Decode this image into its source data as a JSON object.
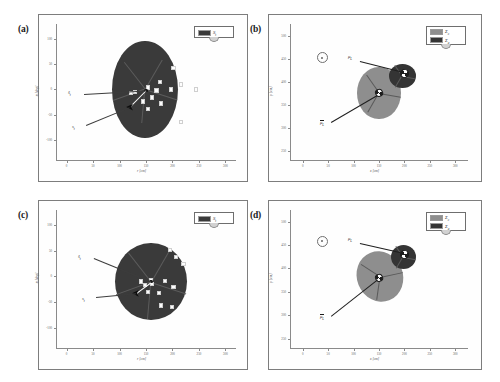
{
  "figure": {
    "panels": [
      {
        "tag": "(a)",
        "legend": [
          {
            "label": "S",
            "sub": "t",
            "color": "#3a3a3a"
          }
        ],
        "annotations": [
          {
            "label": "ŝ",
            "sub": "t"
          },
          {
            "label": "s",
            "sub": "t"
          }
        ],
        "chart_data": {
          "type": "scatter",
          "title": "",
          "xlabel": "r [cm]",
          "ylabel": "α [deg]",
          "xlim": [
            -20,
            320
          ],
          "ylim": [
            -140,
            130
          ],
          "xticks": [
            0,
            50,
            100,
            150,
            200,
            250,
            300
          ],
          "xticklabels": [
            "0",
            "50",
            "100",
            "150",
            "200",
            "250",
            "300"
          ],
          "yticks": [
            -100,
            -50,
            0,
            50,
            100
          ],
          "yticklabels": [
            "-100",
            "-50",
            "0",
            "50",
            "100"
          ],
          "grid": false,
          "legend_position": "upper-right",
          "region": {
            "name": "S_t",
            "shape": "ellipse",
            "center": [
              148,
              0
            ],
            "semi_axis_x": 62,
            "semi_axis_y": 97,
            "fill": "#3a3a3a"
          },
          "points": [
            [
              200,
              45
            ],
            [
              175,
              17
            ],
            [
              215,
              12
            ],
            [
              243,
              2
            ],
            [
              128,
              -3
            ],
            [
              152,
              6
            ],
            [
              168,
              0
            ],
            [
              196,
              2
            ],
            [
              143,
              -22
            ],
            [
              176,
              -26
            ],
            [
              152,
              -37
            ],
            [
              214,
              -63
            ],
            [
              120,
              -5
            ],
            [
              160,
              -14
            ]
          ],
          "estimate_point": [
            119,
            -35
          ],
          "true_point": [
            150,
            -2
          ]
        }
      },
      {
        "tag": "(b)",
        "legend": [
          {
            "label": "Σ",
            "sub": "c",
            "color": "#8e8e8e"
          },
          {
            "label": "Σ",
            "sub": "a",
            "color": "#343434"
          }
        ],
        "annotations": [
          {
            "label": "μ",
            "sub": "L"
          },
          {
            "label": "μ̄",
            "sub": "L"
          }
        ],
        "chart_data": {
          "type": "scatter",
          "title": "",
          "xlabel": "x [cm]",
          "ylabel": "y [cm]",
          "xlim": [
            -25,
            325
          ],
          "ylim": [
            230,
            525
          ],
          "xticks": [
            0,
            50,
            100,
            150,
            200,
            250,
            300
          ],
          "xticklabels": [
            "0",
            "50",
            "100",
            "150",
            "200",
            "250",
            "300"
          ],
          "yticks": [
            250,
            300,
            350,
            400,
            450,
            500
          ],
          "yticklabels": [
            "250",
            "300",
            "350",
            "400",
            "450",
            "500"
          ],
          "grid": false,
          "legend_position": "upper-right",
          "ellipses": [
            {
              "name": "Σ_c",
              "center": [
                150,
                375
              ],
              "semi_axis_x": 43,
              "semi_axis_y": 57,
              "angle": 0,
              "fill": "#8e8e8e"
            },
            {
              "name": "Σ_a",
              "center": [
                196,
                412
              ],
              "semi_axis_x": 26,
              "semi_axis_y": 26,
              "angle": 0,
              "fill": "#343434"
            }
          ],
          "markers": [
            {
              "name": "μ_L",
              "position": [
                200,
                418
              ],
              "style": "pie-quadrant"
            },
            {
              "name": "μ̄_L",
              "position": [
                150,
                375
              ],
              "style": "pie-quadrant"
            }
          ],
          "reference_marker": {
            "position": [
              38,
              452
            ],
            "style": "circle-dot"
          }
        }
      },
      {
        "tag": "(c)",
        "legend": [
          {
            "label": "S",
            "sub": "t",
            "color": "#3a3a3a"
          }
        ],
        "annotations": [
          {
            "label": "ŝ",
            "sub": "t"
          },
          {
            "label": "s",
            "sub": "t"
          }
        ],
        "chart_data": {
          "type": "scatter",
          "title": "",
          "xlabel": "r [cm]",
          "ylabel": "α [deg]",
          "xlim": [
            -20,
            320
          ],
          "ylim": [
            -140,
            130
          ],
          "xticks": [
            0,
            50,
            100,
            150,
            200,
            250,
            300
          ],
          "xticklabels": [
            "0",
            "50",
            "100",
            "150",
            "200",
            "250",
            "300"
          ],
          "yticks": [
            -100,
            -50,
            0,
            50,
            100
          ],
          "yticklabels": [
            "-100",
            "-50",
            "0",
            "50",
            "100"
          ],
          "grid": false,
          "legend_position": "upper-right",
          "region": {
            "name": "S_t",
            "shape": "circle",
            "center": [
              160,
              -10
            ],
            "semi_axis_x": 68,
            "semi_axis_y": 76,
            "fill": "#3a3a3a"
          },
          "points": [
            [
              193,
              54
            ],
            [
              205,
              40
            ],
            [
              219,
              26
            ],
            [
              138,
              -8
            ],
            [
              158,
              -6
            ],
            [
              184,
              -7
            ],
            [
              200,
              -19
            ],
            [
              152,
              -28
            ],
            [
              173,
              -30
            ],
            [
              176,
              -55
            ],
            [
              198,
              -58
            ],
            [
              160,
              -13
            ],
            [
              146,
              -14
            ]
          ],
          "estimate_point": [
            130,
            -33
          ],
          "true_point": [
            160,
            -10
          ]
        }
      },
      {
        "tag": "(d)",
        "legend": [
          {
            "label": "Σ",
            "sub": "c",
            "color": "#8e8e8e"
          },
          {
            "label": "Σ",
            "sub": "a",
            "color": "#343434"
          }
        ],
        "annotations": [
          {
            "label": "μ",
            "sub": "L"
          },
          {
            "label": "μ̄",
            "sub": "L"
          }
        ],
        "chart_data": {
          "type": "scatter",
          "title": "",
          "xlabel": "x [cm]",
          "ylabel": "y [cm]",
          "xlim": [
            -25,
            325
          ],
          "ylim": [
            230,
            525
          ],
          "xticks": [
            0,
            50,
            100,
            150,
            200,
            250,
            300
          ],
          "xticklabels": [
            "0",
            "50",
            "100",
            "150",
            "200",
            "250",
            "300"
          ],
          "yticks": [
            250,
            300,
            350,
            400,
            450,
            500
          ],
          "yticklabels": [
            "250",
            "300",
            "350",
            "400",
            "450",
            "500"
          ],
          "grid": false,
          "legend_position": "upper-right",
          "ellipses": [
            {
              "name": "Σ_c",
              "center": [
                152,
                382
              ],
              "semi_axis_x": 45,
              "semi_axis_y": 55,
              "angle": -22,
              "fill": "#8e8e8e"
            },
            {
              "name": "Σ_a",
              "center": [
                198,
                425
              ],
              "semi_axis_x": 25,
              "semi_axis_y": 26,
              "angle": 0,
              "fill": "#343434"
            }
          ],
          "markers": [
            {
              "name": "μ_L",
              "position": [
                200,
                430
              ],
              "style": "pie-quadrant"
            },
            {
              "name": "μ̄_L",
              "position": [
                150,
                380
              ],
              "style": "pie-quadrant"
            }
          ],
          "reference_marker": {
            "position": [
              38,
              458
            ],
            "style": "circle-dot"
          }
        }
      }
    ]
  }
}
